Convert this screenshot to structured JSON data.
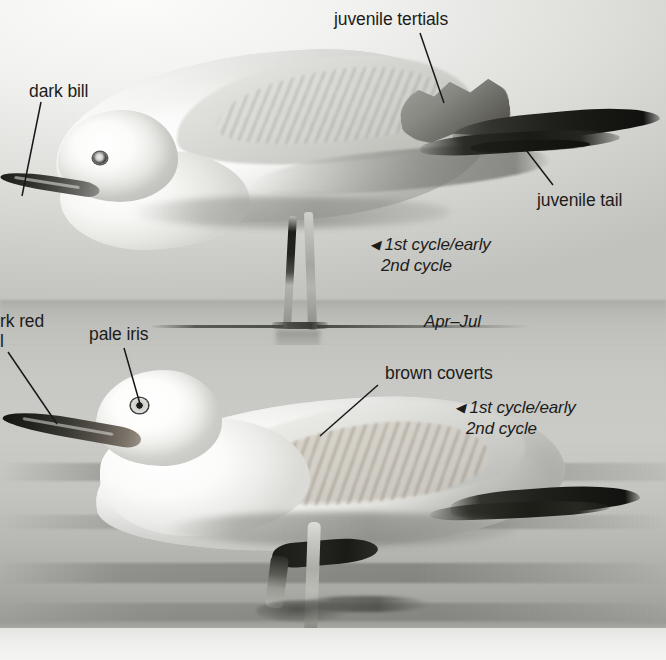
{
  "plate": {
    "title": "Gull plumage plate — 1st cycle / early 2nd cycle",
    "width": 666,
    "height": 660
  },
  "colors": {
    "label_text": "#1c1c1a",
    "leader_line": "#18181a",
    "photo_background_top": "#d8d8d4",
    "photo_background_bottom": "#c4c4c0"
  },
  "annotations": {
    "dark_bill": "dark bill",
    "juvenile_tertials": "juvenile tertials",
    "juvenile_tail": "juvenile tail",
    "dark_red_bill_clipped_line1": "rk red",
    "dark_red_bill_clipped_line2": "l",
    "pale_iris": "pale iris",
    "brown_coverts": "brown coverts"
  },
  "captions": {
    "top_bird": {
      "caret": "◀",
      "line1": "1st cycle/early",
      "line2": "2nd cycle",
      "months": "Apr–Jul"
    },
    "bottom_bird": {
      "caret": "◀",
      "line1": "1st cycle/early",
      "line2": "2nd cycle"
    }
  },
  "figures": [
    {
      "name": "top-gull",
      "description": "standing gull, side view, facing left, juvenile tertials and tail visible"
    },
    {
      "name": "bottom-gull",
      "description": "standing gull in shallow water, side view, facing left, brown coverts visible"
    }
  ]
}
